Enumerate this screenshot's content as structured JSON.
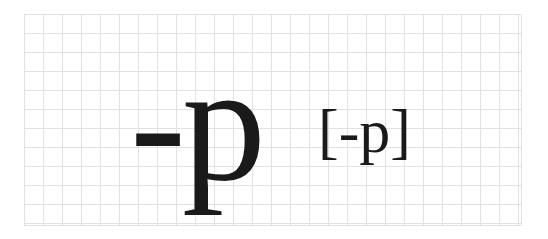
{
  "symbol": "-p",
  "notation": "[-p]"
}
